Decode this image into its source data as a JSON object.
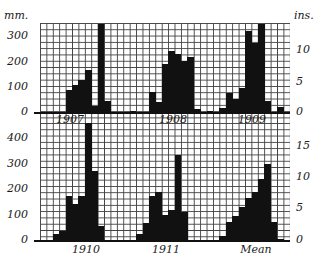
{
  "chart_data": {
    "type": "bar",
    "title": "",
    "xlabel": "",
    "ylabel_left": "mm.",
    "ylabel_right": "ins.",
    "categories": [
      "Jan",
      "Feb",
      "Mar",
      "Apr",
      "May",
      "Jun",
      "Jul",
      "Aug",
      "Sep",
      "Oct",
      "Nov",
      "Dec"
    ],
    "panels": [
      {
        "row": "top",
        "series": [
          {
            "name": "1907",
            "values": [
              0,
              0,
              0,
              0,
              85,
              105,
              125,
              165,
              25,
              345,
              45,
              0
            ]
          },
          {
            "name": "1908",
            "values": [
              0,
              5,
              0,
              0,
              80,
              40,
              190,
              240,
              230,
              200,
              215,
              10
            ]
          },
          {
            "name": "1909",
            "values": [
              5,
              0,
              15,
              75,
              50,
              95,
              320,
              270,
              345,
              45,
              0,
              20
            ]
          }
        ],
        "ylim_mm": [
          0,
          350
        ],
        "yticks_mm": [
          0,
          100,
          200,
          300
        ],
        "ylim_ins": [
          0,
          14
        ],
        "yticks_ins": [
          0,
          5,
          10
        ]
      },
      {
        "row": "bottom",
        "series": [
          {
            "name": "1910",
            "values": [
              0,
              0,
              25,
              35,
              175,
              140,
              175,
              470,
              270,
              55,
              0,
              0
            ]
          },
          {
            "name": "1911",
            "values": [
              0,
              0,
              25,
              65,
              175,
              190,
              100,
              120,
              335,
              110,
              0,
              0
            ]
          },
          {
            "name": "Mean",
            "values": [
              0,
              0,
              15,
              70,
              95,
              130,
              165,
              190,
              240,
              300,
              70,
              5
            ]
          }
        ],
        "ylim_mm": [
          0,
          470
        ],
        "yticks_mm": [
          0,
          100,
          200,
          300,
          400
        ],
        "ylim_ins": [
          0,
          18
        ],
        "yticks_ins": [
          0,
          5,
          10,
          15
        ]
      }
    ],
    "grid": true,
    "legend": "none"
  },
  "labels": {
    "unit_left": "mm.",
    "unit_right": "ins.",
    "top_years": [
      "1907",
      "1908",
      "1909"
    ],
    "bottom_years": [
      "1910",
      "1911",
      "Mean"
    ],
    "top_left_ticks": [
      "300",
      "200",
      "100",
      "0"
    ],
    "top_right_ticks": [
      "10",
      "5",
      "0"
    ],
    "bottom_left_ticks": [
      "400",
      "300",
      "200",
      "100",
      "0"
    ],
    "bottom_right_ticks": [
      "15",
      "10",
      "5",
      "0"
    ]
  }
}
